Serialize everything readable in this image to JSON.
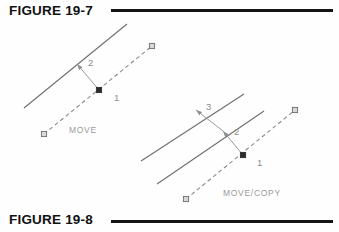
{
  "page": {
    "background_color": "#fefefe",
    "width": 339,
    "height": 232
  },
  "captions": {
    "top": {
      "label": "FIGURE 19-7",
      "rule_color": "#141414"
    },
    "bottom": {
      "label": "FIGURE 19-8",
      "rule_color": "#141414"
    }
  },
  "diagrams": [
    {
      "id": "move-diagram",
      "command_label": "MOVE",
      "figure": "FIGURE 19-7",
      "point_labels": [
        "1",
        "2"
      ],
      "description_colors": {
        "solid_line": "#6e6e6e",
        "dashed_line": "#8a8a8a",
        "leader": "#8e8e8e",
        "label_text": "#8d8d8d",
        "command_text": "#9a9a9a"
      },
      "geometry": {
        "solid_lines": [
          {
            "x1": 24,
            "y1": 108,
            "x2": 127,
            "y2": 24
          }
        ],
        "dashed_line": {
          "x1": 44,
          "y1": 134,
          "x2": 152,
          "y2": 46
        },
        "grips": [
          {
            "x": 44,
            "y": 134,
            "type": "open"
          },
          {
            "x": 152,
            "y": 46,
            "type": "open"
          },
          {
            "x": 99,
            "y": 90,
            "type": "filled"
          }
        ],
        "leaders": [
          {
            "from_x": 99,
            "from_y": 90,
            "to_x": 77,
            "to_y": 64,
            "label": "2",
            "label_x": 88,
            "label_y": 66
          }
        ],
        "base_label": {
          "text": "1",
          "x": 114,
          "y": 101
        },
        "command_text_pos": {
          "x": 69,
          "y": 133
        }
      }
    },
    {
      "id": "move-copy-diagram",
      "command_label": "MOVE/COPY",
      "figure": "FIGURE 19-8",
      "point_labels": [
        "1",
        "2",
        "3"
      ],
      "description_colors": {
        "solid_line": "#6e6e6e",
        "dashed_line": "#8a8a8a",
        "leader": "#8e8e8e",
        "label_text": "#8d8d8d",
        "command_text": "#9a9a9a"
      },
      "geometry": {
        "solid_lines": [
          {
            "x1": 141,
            "y1": 161,
            "x2": 244,
            "y2": 94
          },
          {
            "x1": 157,
            "y1": 184,
            "x2": 264,
            "y2": 111
          }
        ],
        "dashed_line": {
          "x1": 186,
          "y1": 199,
          "x2": 295,
          "y2": 110
        },
        "grips": [
          {
            "x": 186,
            "y": 199,
            "type": "open"
          },
          {
            "x": 295,
            "y": 110,
            "type": "open"
          },
          {
            "x": 243,
            "y": 155,
            "type": "filled"
          }
        ],
        "leaders": [
          {
            "from_x": 243,
            "from_y": 155,
            "to_x": 223,
            "to_y": 131,
            "label": "2",
            "label_x": 234,
            "label_y": 135
          },
          {
            "from_x": 223,
            "from_y": 131,
            "to_x": 196,
            "to_y": 110,
            "label": "3",
            "label_x": 206,
            "label_y": 110
          }
        ],
        "base_label": {
          "text": "1",
          "x": 257,
          "y": 166
        },
        "command_text_pos": {
          "x": 223,
          "y": 196
        }
      }
    }
  ]
}
